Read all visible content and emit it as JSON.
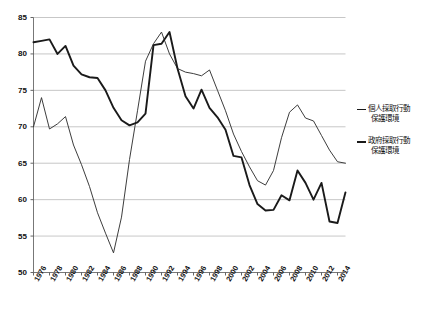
{
  "chart_data": {
    "type": "line",
    "title": "",
    "xlabel": "",
    "ylabel": "",
    "ylim": [
      50,
      85
    ],
    "ytick_step": 5,
    "yticks": [
      50,
      55,
      60,
      65,
      70,
      75,
      80,
      85
    ],
    "grid": "horizontal",
    "legend_position": "right",
    "x": [
      1976,
      1977,
      1978,
      1979,
      1980,
      1981,
      1982,
      1983,
      1984,
      1985,
      1986,
      1987,
      1988,
      1989,
      1990,
      1991,
      1992,
      1993,
      1994,
      1995,
      1996,
      1997,
      1998,
      1999,
      2000,
      2001,
      2002,
      2003,
      2004,
      2005,
      2006,
      2007,
      2008,
      2009,
      2010,
      2011,
      2012,
      2013,
      2014,
      2015
    ],
    "xtick_labels": [
      "1976",
      "1978",
      "1980",
      "1982",
      "1984",
      "1986",
      "1988",
      "1990",
      "1992",
      "1994",
      "1996",
      "1998",
      "2000",
      "2002",
      "2004",
      "2006",
      "2008",
      "2010",
      "2012",
      "2014"
    ],
    "series": [
      {
        "name": "個人採取行動保護環境",
        "style": "thin",
        "color": "#333333",
        "values": [
          70.0,
          74.0,
          69.7,
          70.4,
          71.4,
          67.5,
          64.8,
          61.8,
          58.2,
          55.4,
          52.7,
          57.6,
          65.5,
          72.2,
          79.0,
          81.4,
          83.0,
          80.0,
          78.0,
          77.5,
          77.3,
          77.0,
          77.8,
          75.0,
          72.2,
          69.0,
          66.6,
          64.5,
          62.6,
          62.0,
          64.0,
          68.5,
          72.0,
          73.0,
          71.2,
          70.8,
          68.8,
          66.8,
          65.2,
          65.0
        ]
      },
      {
        "name": "政府採取行動保護環境",
        "style": "bold",
        "color": "#1a1a1a",
        "values": [
          81.6,
          81.8,
          82.0,
          80.0,
          81.1,
          78.4,
          77.2,
          76.8,
          76.7,
          75.0,
          72.6,
          70.9,
          70.2,
          70.6,
          71.8,
          81.2,
          81.4,
          83.0,
          78.0,
          74.2,
          72.5,
          75.1,
          72.6,
          71.3,
          69.6,
          66.0,
          65.8,
          62.0,
          59.4,
          58.5,
          58.6,
          60.6,
          59.9,
          64.0,
          62.3,
          60.0,
          62.3,
          57.0,
          56.8,
          61.0
        ]
      }
    ]
  },
  "legend": {
    "entries": [
      {
        "line1": "個人採取行動",
        "line2": "保護環境",
        "style": "thin"
      },
      {
        "line1": "政府採取行動",
        "line2": "保護環境",
        "style": "bold"
      }
    ]
  }
}
